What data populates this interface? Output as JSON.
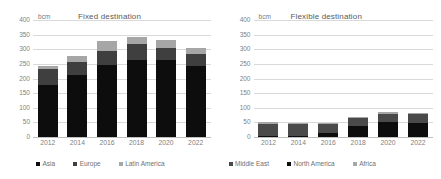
{
  "chart_data": [
    {
      "type": "bar",
      "title": "Fixed destination",
      "unit_label": "bcm",
      "xlabel": "",
      "ylabel": "bcm",
      "ylim": [
        0,
        400
      ],
      "yticks": [
        0,
        50,
        100,
        150,
        200,
        250,
        300,
        350,
        400
      ],
      "grid": true,
      "stacked": true,
      "legend_position": "bottom",
      "categories": [
        "2012",
        "2014",
        "2016",
        "2018",
        "2020",
        "2022"
      ],
      "series": [
        {
          "name": "Asia",
          "color": "#0d0d0d",
          "values": [
            177,
            213,
            245,
            264,
            264,
            242
          ]
        },
        {
          "name": "Europe",
          "color": "#3f3f3f",
          "values": [
            55,
            44,
            50,
            53,
            42,
            43
          ]
        },
        {
          "name": "Latin America",
          "color": "#a6a6a6",
          "values": [
            11,
            21,
            33,
            25,
            25,
            18
          ]
        }
      ],
      "totals": [
        243,
        278,
        328,
        342,
        331,
        303
      ]
    },
    {
      "type": "bar",
      "title": "Flexible destination",
      "unit_label": "bcm",
      "xlabel": "",
      "ylabel": "bcm",
      "ylim": [
        0,
        400
      ],
      "yticks": [
        0,
        50,
        100,
        150,
        200,
        250,
        300,
        350,
        400
      ],
      "grid": true,
      "stacked": true,
      "legend_position": "bottom",
      "categories": [
        "2012",
        "2014",
        "2016",
        "2018",
        "2020",
        "2022"
      ],
      "series": [
        {
          "name": "North America",
          "color": "#0d0d0d",
          "values": [
            5,
            5,
            13,
            38,
            50,
            48
          ]
        },
        {
          "name": "Middle East",
          "color": "#4a4a4a",
          "values": [
            40,
            40,
            33,
            28,
            30,
            30
          ]
        },
        {
          "name": "Africa",
          "color": "#a6a6a6",
          "values": [
            5,
            4,
            3,
            4,
            5,
            4
          ]
        }
      ],
      "totals": [
        50,
        49,
        49,
        70,
        85,
        82
      ]
    }
  ],
  "panels": {
    "left": {
      "title": "Fixed destination",
      "unit": "bcm",
      "yticks": [
        "400",
        "350",
        "300",
        "250",
        "200",
        "150",
        "100",
        "50",
        "0"
      ],
      "xticks": [
        "2012",
        "2014",
        "2016",
        "2018",
        "2020",
        "2022"
      ],
      "legend": [
        {
          "label": "Asia",
          "color": "#0d0d0d"
        },
        {
          "label": "Europe",
          "color": "#3f3f3f"
        },
        {
          "label": "Latin America",
          "color": "#a6a6a6"
        }
      ]
    },
    "right": {
      "title": "Flexible destination",
      "unit": "bcm",
      "yticks": [
        "400",
        "350",
        "300",
        "250",
        "200",
        "150",
        "100",
        "50",
        "0"
      ],
      "xticks": [
        "2012",
        "2014",
        "2016",
        "2018",
        "2020",
        "2022"
      ],
      "legend": [
        {
          "label": "Middle East",
          "color": "#4a4a4a"
        },
        {
          "label": "North America",
          "color": "#0d0d0d"
        },
        {
          "label": "Africa",
          "color": "#a6a6a6"
        }
      ]
    }
  }
}
